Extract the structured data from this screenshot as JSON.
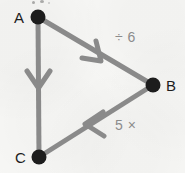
{
  "diagram": {
    "type": "directed-graph",
    "title": "",
    "background_color": "#f7f7f5",
    "edge_color": "#8a8a8a",
    "vertex_color": "#1d1d1d",
    "vertex_label_color": "#1d1d1d",
    "edge_label_color": "#8c8c8c",
    "nodes": [
      {
        "id": "A",
        "label": "A",
        "x": 38,
        "y": 17
      },
      {
        "id": "B",
        "label": "B",
        "x": 153,
        "y": 85
      },
      {
        "id": "C",
        "label": "C",
        "x": 39,
        "y": 157
      }
    ],
    "edges": [
      {
        "id": "a-to-b",
        "from": "A",
        "to": "B",
        "label": "÷ 6",
        "arrow_direction": "down-right",
        "arrow_position": 0.52
      },
      {
        "id": "b-to-c",
        "from": "B",
        "to": "C",
        "label": "5 ×",
        "arrow_direction": "down-left",
        "arrow_position": 0.56
      },
      {
        "id": "a-to-c",
        "from": "A",
        "to": "C",
        "label": "",
        "arrow_direction": "down",
        "arrow_position": 0.45
      }
    ]
  }
}
